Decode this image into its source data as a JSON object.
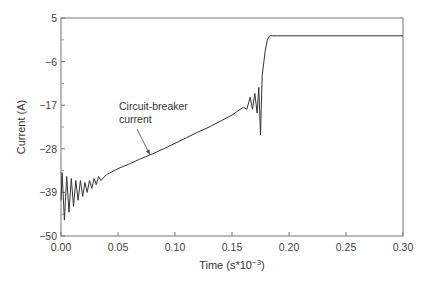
{
  "chart_data": {
    "type": "line",
    "title": "",
    "xlabel": "Time (s*10^-3)",
    "xlabel_main": "Time (s*10",
    "xlabel_exp": "−3",
    "xlabel_close": ")",
    "ylabel": "Current (A)",
    "xlim": [
      0.0,
      0.3
    ],
    "ylim": [
      -50,
      5
    ],
    "xticks": [
      "0.00",
      "0.05",
      "0.10",
      "0.15",
      "0.20",
      "0.25",
      "0.30"
    ],
    "xtick_values": [
      0.0,
      0.05,
      0.1,
      0.15,
      0.2,
      0.25,
      0.3
    ],
    "yticks": [
      "5",
      "−6",
      "−17",
      "−28",
      "−39",
      "−50"
    ],
    "ytick_values": [
      5,
      -6,
      -17,
      -28,
      -39,
      -50
    ],
    "grid": false,
    "legend": null,
    "annotations": [
      {
        "text_line1": "Circuit-breaker",
        "text_line2": "current",
        "arrow_to": [
          0.078,
          -29.5
        ]
      }
    ],
    "series": [
      {
        "name": "Circuit-breaker current",
        "color": "#333333",
        "x": [
          0.0,
          0.001,
          0.003,
          0.005,
          0.007,
          0.009,
          0.011,
          0.013,
          0.015,
          0.017,
          0.019,
          0.021,
          0.023,
          0.025,
          0.027,
          0.029,
          0.031,
          0.033,
          0.035,
          0.04,
          0.05,
          0.06,
          0.07,
          0.08,
          0.09,
          0.1,
          0.11,
          0.12,
          0.13,
          0.14,
          0.15,
          0.155,
          0.16,
          0.163,
          0.166,
          0.168,
          0.17,
          0.172,
          0.1735,
          0.175,
          0.1765,
          0.178,
          0.179,
          0.181,
          0.183,
          0.185,
          0.19,
          0.2,
          0.25,
          0.3
        ],
        "y": [
          -41,
          -34,
          -46,
          -35,
          -44,
          -35.5,
          -42.5,
          -36,
          -41,
          -36,
          -40,
          -36.5,
          -39,
          -36,
          -38,
          -35.5,
          -37,
          -35,
          -36,
          -34.5,
          -33,
          -31.8,
          -30.5,
          -29.3,
          -28,
          -26.6,
          -25.2,
          -23.8,
          -22.5,
          -21,
          -19.5,
          -18.5,
          -17.5,
          -18,
          -15,
          -18,
          -14,
          -19,
          -12.5,
          -24.5,
          -9.5,
          -6,
          -3.5,
          -0.5,
          0.5,
          0.5,
          0.5,
          0.5,
          0.5,
          0.5
        ]
      }
    ]
  },
  "colors": {
    "line": "#333333",
    "axis": "#666666",
    "background": "#ffffff"
  }
}
